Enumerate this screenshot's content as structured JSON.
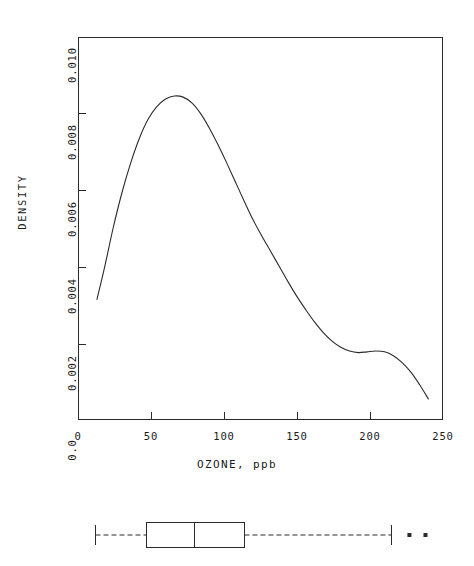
{
  "figure": {
    "background_color": "#ffffff",
    "line_color": "#2b2b2b"
  },
  "density_panel": {
    "y_axis_title": "DENSITY",
    "x_axis_title": "OZONE, ppb",
    "x_tick_labels": [
      "0",
      "50",
      "100",
      "150",
      "200",
      "250"
    ],
    "y_tick_labels": [
      "0.0",
      "0.002",
      "0.004",
      "0.006",
      "0.008",
      "0.010"
    ]
  },
  "boxplot_panel": {
    "name": "ozone-boxplot",
    "whisker_style": "dashed",
    "outlier_marker": "filled-square"
  },
  "chart_data": {
    "type": "line",
    "title": "",
    "xlabel": "OZONE, ppb",
    "ylabel": "DENSITY",
    "xlim": [
      0,
      250
    ],
    "ylim": [
      0.0,
      0.01
    ],
    "xticks": [
      0,
      50,
      100,
      150,
      200,
      250
    ],
    "yticks": [
      0.0,
      0.002,
      0.004,
      0.006,
      0.008,
      0.01
    ],
    "grid": false,
    "legend": "none",
    "series": [
      {
        "name": "Kernel density estimate of ozone",
        "x": [
          13,
          18,
          24,
          30,
          36,
          42,
          48,
          54,
          60,
          66,
          72,
          78,
          84,
          90,
          96,
          102,
          108,
          114,
          120,
          126,
          132,
          138,
          144,
          150,
          156,
          162,
          168,
          174,
          180,
          186,
          192,
          198,
          204,
          210,
          216,
          222,
          228,
          234,
          240
        ],
        "y": [
          0.00315,
          0.00395,
          0.005,
          0.00592,
          0.0067,
          0.00735,
          0.00785,
          0.00818,
          0.00838,
          0.00846,
          0.00843,
          0.00828,
          0.008,
          0.00762,
          0.00718,
          0.0067,
          0.0062,
          0.0057,
          0.00522,
          0.0048,
          0.0044,
          0.004,
          0.0036,
          0.00322,
          0.00288,
          0.00256,
          0.00228,
          0.00206,
          0.0019,
          0.0018,
          0.00176,
          0.00178,
          0.0018,
          0.00178,
          0.00168,
          0.0015,
          0.00125,
          0.00092,
          0.00055
        ]
      }
    ],
    "annotations": {
      "primary_mode_x": 70,
      "primary_mode_y": 0.00846,
      "secondary_mode_x": 195,
      "secondary_mode_y": 0.0018
    },
    "boxplot": {
      "orientation": "horizontal",
      "whisker_min": 12,
      "q1": 47,
      "median": 80,
      "q3": 114,
      "whisker_max": 215,
      "outliers": [
        227,
        238
      ]
    }
  }
}
